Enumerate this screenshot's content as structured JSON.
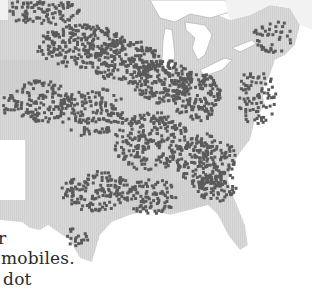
{
  "figure": {
    "type": "dot-distribution map",
    "region": "Central and Eastern United States",
    "land_color": "#d8d8d8",
    "land_dark_color": "#c6c6c6",
    "water_color": "#ffffff",
    "lake_outline_color": "#b8b8b8",
    "dot_color": "#5a5a5a",
    "dot_size": 3,
    "seed": 7,
    "clusters": [
      {
        "cx": 40,
        "cy": 10,
        "rx": 38,
        "ry": 14,
        "n": 110
      },
      {
        "cx": 80,
        "cy": 45,
        "rx": 45,
        "ry": 22,
        "n": 230
      },
      {
        "cx": 125,
        "cy": 60,
        "rx": 35,
        "ry": 22,
        "n": 200
      },
      {
        "cx": 160,
        "cy": 80,
        "rx": 30,
        "ry": 22,
        "n": 190
      },
      {
        "cx": 195,
        "cy": 95,
        "rx": 25,
        "ry": 25,
        "n": 150
      },
      {
        "cx": 40,
        "cy": 100,
        "rx": 28,
        "ry": 22,
        "n": 110
      },
      {
        "cx": 90,
        "cy": 110,
        "rx": 35,
        "ry": 25,
        "n": 160
      },
      {
        "cx": 150,
        "cy": 140,
        "rx": 38,
        "ry": 30,
        "n": 230
      },
      {
        "cx": 205,
        "cy": 160,
        "rx": 30,
        "ry": 28,
        "n": 190
      },
      {
        "cx": 95,
        "cy": 190,
        "rx": 35,
        "ry": 20,
        "n": 150
      },
      {
        "cx": 150,
        "cy": 195,
        "rx": 25,
        "ry": 18,
        "n": 90
      },
      {
        "cx": 215,
        "cy": 185,
        "rx": 20,
        "ry": 15,
        "n": 70
      },
      {
        "cx": 255,
        "cy": 95,
        "rx": 20,
        "ry": 28,
        "n": 80
      },
      {
        "cx": 272,
        "cy": 35,
        "rx": 20,
        "ry": 16,
        "n": 45
      },
      {
        "cx": 8,
        "cy": 100,
        "rx": 8,
        "ry": 15,
        "n": 15
      },
      {
        "cx": 75,
        "cy": 235,
        "rx": 12,
        "ry": 10,
        "n": 18
      }
    ]
  },
  "caption_lines": [
    "r",
    "mobiles.",
    "the dot"
  ]
}
